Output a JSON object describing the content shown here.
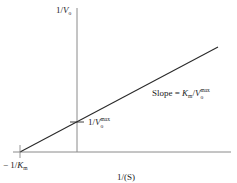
{
  "diagram": {
    "type": "Lineweaver-Burk double-reciprocal plot",
    "y_axis_label": {
      "prefix": "1/",
      "var": "V",
      "sub": "o"
    },
    "x_axis_label": "1/(S)",
    "y_intercept_label": {
      "prefix": "1/",
      "var": "V",
      "sub": "o",
      "sup": "max"
    },
    "x_intercept_label": {
      "prefix": "− 1/",
      "var": "K",
      "sub": "m"
    },
    "slope_label": {
      "prefix": "Slope = ",
      "num_var": "K",
      "num_sub": "m",
      "sep": "/",
      "den_var": "V",
      "den_sub": "o",
      "den_sup": "max"
    },
    "colors": {
      "axis": "#8a8a8a",
      "line": "#2a2a2a",
      "text": "#222222",
      "background": "#ffffff"
    },
    "geometry": {
      "x_axis": {
        "x1": 13,
        "y": 152,
        "x2": 231
      },
      "y_axis": {
        "x": 77,
        "y1": 8,
        "y2": 152
      },
      "line": {
        "x1": 20,
        "y1": 152,
        "x2": 218,
        "y2": 47
      },
      "y_intercept_tick": {
        "x1": 70,
        "x2": 84,
        "y": 122
      },
      "x_intercept_tick": {
        "x": 20,
        "y1": 145,
        "y2": 158
      }
    }
  }
}
